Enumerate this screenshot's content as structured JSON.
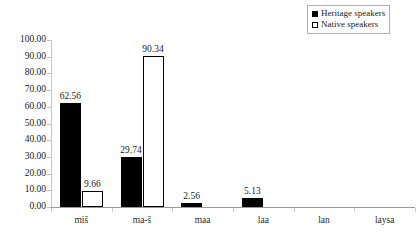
{
  "chart_data": {
    "type": "bar",
    "title": "",
    "xlabel": "",
    "ylabel": "",
    "ylim": [
      0,
      100
    ],
    "ytick_step": 10,
    "grid": false,
    "legend_position": "top-right",
    "categories": [
      "miš",
      "ma-š",
      "maa",
      "laa",
      "lan",
      "laysa"
    ],
    "ytick_labels": [
      "0.00",
      "10.00",
      "20.00",
      "30.00",
      "40.00",
      "50.00",
      "60.00",
      "70.00",
      "80.00",
      "90.00",
      "100.00"
    ],
    "ytick_values": [
      0,
      10,
      20,
      30,
      40,
      50,
      60,
      70,
      80,
      90,
      100
    ],
    "series": [
      {
        "name": "Heritage speakers",
        "fill": "#000000",
        "stroke": "#000000",
        "values": [
          62.56,
          29.74,
          2.56,
          5.13,
          0,
          0
        ],
        "labels": [
          "62.56",
          "29.74",
          "2.56",
          "5.13",
          "",
          ""
        ]
      },
      {
        "name": "Native speakers",
        "fill": "#ffffff",
        "stroke": "#000000",
        "values": [
          9.66,
          90.34,
          0,
          0,
          0,
          0
        ],
        "labels": [
          "9.66",
          "90.34",
          "",
          "",
          "",
          ""
        ]
      }
    ]
  },
  "legend": {
    "items": [
      {
        "label": "Heritage speakers",
        "swatch": "filled"
      },
      {
        "label": "Native speakers",
        "swatch": "hollow"
      }
    ]
  },
  "colors": {
    "heritage": "#000000",
    "native": "#ffffff",
    "axis": "#9a9a9a",
    "tick": "#c8c8c8",
    "text": "#1a1a1a",
    "background": "#ffffff"
  }
}
